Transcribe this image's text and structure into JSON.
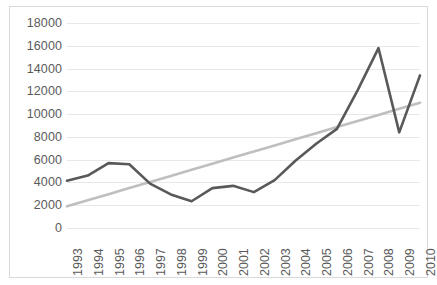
{
  "chart_data": {
    "type": "line",
    "title": "",
    "subtitle": "",
    "xlabel": "",
    "ylabel": "",
    "categories": [
      "1993",
      "1994",
      "1995",
      "1996",
      "1997",
      "1998",
      "1999",
      "2000",
      "2001",
      "2002",
      "2003",
      "2004",
      "2005",
      "2006",
      "2007",
      "2008",
      "2009",
      "2010"
    ],
    "x": [
      1993,
      1994,
      1995,
      1996,
      1997,
      1998,
      1999,
      2000,
      2001,
      2002,
      2003,
      2004,
      2005,
      2006,
      2007,
      2008,
      2009,
      2010
    ],
    "series": [
      {
        "name": "data-series",
        "color": "#595959",
        "values": [
          4150,
          4600,
          5700,
          5600,
          3900,
          2950,
          2350,
          3500,
          3700,
          3150,
          4200,
          5900,
          7400,
          8700,
          12100,
          15800,
          8400,
          13400
        ]
      },
      {
        "name": "trendline",
        "color": "#bfbfbf",
        "values": [
          1900,
          2435,
          2970,
          3506,
          4041,
          4576,
          5112,
          5647,
          6182,
          6718,
          7253,
          7788,
          8324,
          8859,
          9394,
          9929,
          10465,
          11000
        ]
      }
    ],
    "ylim": [
      0,
      18000
    ],
    "ytick_values": [
      0,
      2000,
      4000,
      6000,
      8000,
      10000,
      12000,
      14000,
      16000,
      18000
    ],
    "ytick_labels": [
      "0",
      "2000",
      "4000",
      "6000",
      "8000",
      "10000",
      "12000",
      "14000",
      "16000",
      "18000"
    ],
    "xtick_labels": [
      "1993",
      "1994",
      "1995",
      "1996",
      "1997",
      "1998",
      "1999",
      "2000",
      "2001",
      "2002",
      "2003",
      "2004",
      "2005",
      "2006",
      "2007",
      "2008",
      "2009",
      "2010"
    ],
    "grid": true,
    "grid_axis": "y",
    "legend": false,
    "legend_position": "none",
    "annotations": [],
    "colors": {
      "series_line": "#595959",
      "trend_line": "#bfbfbf",
      "gridline": "#e8e8e8",
      "axis_text": "#5a5a5a",
      "border": "#d9d9d9",
      "background": "#ffffff"
    }
  }
}
